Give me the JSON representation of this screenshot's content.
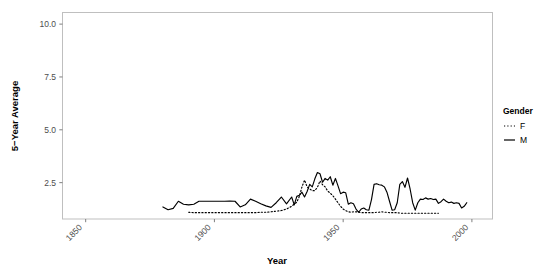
{
  "chart_data": {
    "type": "line",
    "title": "",
    "xlabel": "Year",
    "ylabel": "5−Year Average",
    "xlim": [
      1841,
      2008
    ],
    "ylim": [
      0.78,
      10.55
    ],
    "xticks": [
      1850,
      1900,
      1950,
      2000
    ],
    "xtick_labels": [
      "1850",
      "1900",
      "1950",
      "2000"
    ],
    "yticks": [
      2.5,
      5.0,
      7.5,
      10.0
    ],
    "ytick_labels": [
      "2.5",
      "5.0",
      "7.5",
      "10.0"
    ],
    "grid": false,
    "panel_border": true,
    "legend": {
      "title": "Gender",
      "position": "right",
      "entries": [
        {
          "label": "F",
          "style": "dotted"
        },
        {
          "label": "M",
          "style": "solid"
        }
      ]
    },
    "series": [
      {
        "name": "M",
        "style": "solid",
        "color": "#000000",
        "x": [
          1880,
          1882,
          1884,
          1886,
          1888,
          1890,
          1892,
          1894,
          1896,
          1898,
          1900,
          1902,
          1904,
          1906,
          1908,
          1910,
          1912,
          1914,
          1916,
          1918,
          1920,
          1922,
          1924,
          1926,
          1928,
          1930,
          1931,
          1932,
          1933,
          1934,
          1935,
          1936,
          1937,
          1938,
          1939,
          1940,
          1941,
          1942,
          1943,
          1944,
          1945,
          1946,
          1947,
          1948,
          1949,
          1950,
          1951,
          1952,
          1953,
          1954,
          1955,
          1956,
          1957,
          1958,
          1959,
          1960,
          1961,
          1962,
          1963,
          1964,
          1965,
          1966,
          1967,
          1968,
          1969,
          1970,
          1971,
          1972,
          1973,
          1974,
          1975,
          1976,
          1977,
          1978,
          1979,
          1980,
          1981,
          1982,
          1983,
          1984,
          1985,
          1986,
          1987,
          1988,
          1989,
          1990,
          1991,
          1992,
          1993,
          1994,
          1995,
          1996,
          1997,
          1998
        ],
        "y": [
          1.35,
          1.22,
          1.28,
          1.62,
          1.48,
          1.45,
          1.48,
          1.62,
          1.62,
          1.62,
          1.62,
          1.62,
          1.62,
          1.63,
          1.62,
          1.35,
          1.45,
          1.72,
          1.62,
          1.5,
          1.4,
          1.33,
          1.55,
          1.82,
          1.5,
          1.82,
          1.45,
          1.85,
          1.9,
          2.05,
          1.82,
          2.08,
          2.42,
          2.3,
          2.68,
          2.98,
          2.92,
          2.52,
          2.7,
          2.62,
          2.78,
          2.38,
          2.7,
          2.35,
          1.98,
          2.05,
          2.02,
          1.48,
          1.55,
          1.5,
          1.25,
          1.1,
          1.25,
          1.3,
          1.22,
          1.2,
          1.7,
          2.42,
          2.45,
          2.4,
          2.38,
          2.3,
          2.05,
          1.62,
          1.2,
          1.22,
          1.55,
          2.42,
          2.55,
          2.28,
          2.72,
          2.2,
          1.55,
          1.2,
          1.55,
          1.72,
          1.7,
          1.78,
          1.72,
          1.75,
          1.7,
          1.72,
          1.52,
          1.6,
          1.72,
          1.62,
          1.55,
          1.58,
          1.52,
          1.55,
          1.52,
          1.3,
          1.38,
          1.55
        ]
      },
      {
        "name": "F",
        "style": "dotted",
        "color": "#000000",
        "x": [
          1890,
          1892,
          1894,
          1896,
          1898,
          1900,
          1902,
          1904,
          1906,
          1908,
          1910,
          1912,
          1914,
          1916,
          1918,
          1920,
          1922,
          1924,
          1926,
          1928,
          1930,
          1931,
          1932,
          1933,
          1934,
          1935,
          1936,
          1937,
          1938,
          1939,
          1940,
          1941,
          1942,
          1943,
          1944,
          1945,
          1946,
          1947,
          1948,
          1949,
          1950,
          1951,
          1952,
          1953,
          1954,
          1955,
          1956,
          1957,
          1958,
          1959,
          1960,
          1961,
          1962,
          1963,
          1964,
          1965,
          1966,
          1967,
          1968,
          1969,
          1970,
          1971,
          1972,
          1973,
          1974,
          1975,
          1976,
          1977,
          1978,
          1979,
          1980,
          1981,
          1982,
          1983,
          1984,
          1985,
          1986,
          1987
        ],
        "y": [
          1.1,
          1.08,
          1.08,
          1.08,
          1.08,
          1.08,
          1.08,
          1.08,
          1.08,
          1.08,
          1.08,
          1.08,
          1.08,
          1.08,
          1.1,
          1.1,
          1.12,
          1.15,
          1.18,
          1.25,
          1.38,
          1.48,
          1.58,
          1.85,
          2.3,
          2.62,
          2.3,
          2.2,
          2.12,
          2.12,
          2.28,
          2.58,
          2.4,
          2.3,
          2.1,
          2.0,
          1.88,
          1.72,
          1.55,
          1.38,
          1.25,
          1.18,
          1.12,
          1.1,
          1.12,
          1.12,
          1.1,
          1.08,
          1.08,
          1.08,
          1.08,
          1.08,
          1.08,
          1.1,
          1.1,
          1.12,
          1.1,
          1.1,
          1.08,
          1.08,
          1.08,
          1.08,
          1.06,
          1.05,
          1.05,
          1.05,
          1.05,
          1.05,
          1.05,
          1.05,
          1.05,
          1.05,
          1.05,
          1.05,
          1.05,
          1.05,
          1.05,
          1.05
        ]
      }
    ],
    "colors": {
      "line": "#000000",
      "panel_border": "#bfbfbf",
      "tick_mark": "#7f7f7f",
      "tick_label": "#4d4d4d",
      "background": "#ffffff"
    }
  }
}
